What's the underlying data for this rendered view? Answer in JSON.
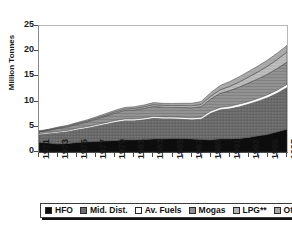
{
  "chart_data": {
    "type": "area",
    "stacked": true,
    "title": "",
    "subtitle": "",
    "xlabel": "",
    "ylabel": "Million Tonnes",
    "ylim": [
      0,
      25
    ],
    "yticks": [
      0,
      5,
      10,
      15,
      20,
      25
    ],
    "grid": false,
    "legend_position": "bottom",
    "x": [
      1971,
      1972,
      1973,
      1974,
      1975,
      1976,
      1977,
      1978,
      1979,
      1980,
      1981,
      1982,
      1983,
      1984,
      1985,
      1986,
      1987,
      1988,
      1989,
      1990,
      1991,
      1992,
      1993,
      1994,
      1995,
      1996,
      1997
    ],
    "xtick_labels": [
      "1971",
      "1973",
      "1975",
      "1977",
      "1979",
      "1981",
      "1983",
      "1985",
      "1987",
      "1989",
      "1991",
      "1993",
      "1995",
      "1997"
    ],
    "series": [
      {
        "name": "HFO",
        "color": "#0d0d0d",
        "pattern": "solid-black",
        "values": [
          1.9,
          1.8,
          1.6,
          1.7,
          1.9,
          2.0,
          2.1,
          2.2,
          2.3,
          2.4,
          2.4,
          2.5,
          2.6,
          2.6,
          2.7,
          2.7,
          2.6,
          2.5,
          2.4,
          2.6,
          2.6,
          2.7,
          2.9,
          3.2,
          3.5,
          4.0,
          4.5
        ]
      },
      {
        "name": "Mid. Dist.",
        "color": "#6e6e6e",
        "pattern": "cross-hatch-dark",
        "values": [
          1.6,
          1.9,
          2.3,
          2.4,
          2.6,
          2.8,
          3.1,
          3.4,
          3.7,
          3.9,
          3.9,
          4.0,
          4.2,
          4.1,
          4.0,
          3.9,
          3.9,
          4.1,
          5.4,
          5.9,
          6.1,
          6.4,
          6.7,
          7.0,
          7.4,
          7.8,
          8.4
        ]
      },
      {
        "name": "Av. Fuels",
        "color": "#ffffff",
        "pattern": "solid-white",
        "values": [
          0.15,
          0.15,
          0.18,
          0.18,
          0.2,
          0.2,
          0.22,
          0.22,
          0.25,
          0.25,
          0.25,
          0.25,
          0.25,
          0.25,
          0.25,
          0.28,
          0.28,
          0.3,
          0.32,
          0.35,
          0.38,
          0.4,
          0.42,
          0.45,
          0.48,
          0.5,
          0.5
        ]
      },
      {
        "name": "Mogas",
        "color": "#8f8f8f",
        "pattern": "horizontal-hatch",
        "values": [
          0.35,
          0.45,
          0.6,
          0.7,
          0.8,
          0.95,
          1.1,
          1.3,
          1.5,
          1.7,
          1.8,
          1.9,
          2.0,
          1.95,
          1.9,
          1.95,
          2.0,
          2.1,
          2.4,
          2.8,
          3.1,
          3.4,
          3.7,
          3.9,
          4.1,
          4.3,
          4.45
        ]
      },
      {
        "name": "LPG**",
        "color": "#b5b5b5",
        "pattern": "light-hatch",
        "values": [
          0.08,
          0.1,
          0.12,
          0.14,
          0.16,
          0.18,
          0.2,
          0.22,
          0.25,
          0.28,
          0.3,
          0.32,
          0.35,
          0.35,
          0.36,
          0.38,
          0.4,
          0.45,
          0.55,
          0.7,
          0.85,
          1.0,
          1.2,
          1.4,
          1.6,
          1.8,
          2.0
        ]
      },
      {
        "name": "Other",
        "color": "#a8a8a8",
        "pattern": "grey-top",
        "values": [
          0.12,
          0.12,
          0.15,
          0.18,
          0.2,
          0.22,
          0.25,
          0.28,
          0.3,
          0.32,
          0.33,
          0.35,
          0.4,
          0.4,
          0.42,
          0.45,
          0.48,
          0.55,
          0.7,
          0.85,
          0.95,
          1.05,
          1.1,
          1.15,
          1.2,
          1.25,
          1.3
        ]
      }
    ],
    "stack_totals": [
      4.2,
      4.52,
      5.05,
      5.3,
      5.86,
      6.35,
      6.98,
      7.62,
      8.3,
      8.85,
      8.98,
      9.32,
      9.8,
      9.65,
      9.63,
      9.66,
      9.66,
      10.0,
      11.77,
      13.2,
      13.98,
      14.95,
      16.02,
      17.1,
      18.28,
      19.65,
      21.15
    ],
    "legend": [
      {
        "label": "HFO",
        "swatch": "solid-black"
      },
      {
        "label": "Mid. Dist.",
        "swatch": "cross-hatch-dark"
      },
      {
        "label": "Av. Fuels",
        "swatch": "solid-white"
      },
      {
        "label": "Mogas",
        "swatch": "horizontal-hatch"
      },
      {
        "label": "LPG**",
        "swatch": "light-hatch"
      },
      {
        "label": "Other",
        "swatch": "grey-top"
      }
    ]
  }
}
